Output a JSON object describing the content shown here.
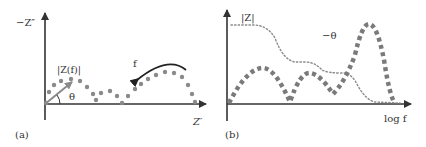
{
  "panel_a": {
    "caption": "(a)",
    "y_axis_label": "−Z″",
    "x_axis_label": "Z′",
    "vector_label": "|Z(f)|",
    "angle_label": "θ",
    "frequency_label": "f",
    "colors": {
      "axis": "#333333",
      "dots": "#8a8a8a",
      "vector": "#8a8a8a",
      "arrow": "#222222"
    }
  },
  "panel_b": {
    "caption": "(b)",
    "magnitude_label": "|Z|",
    "phase_label": "−θ",
    "x_axis_label": "log f",
    "colors": {
      "axis": "#333333",
      "magnitude": "#8a8a8a",
      "phase": "#7a7a7a"
    }
  }
}
